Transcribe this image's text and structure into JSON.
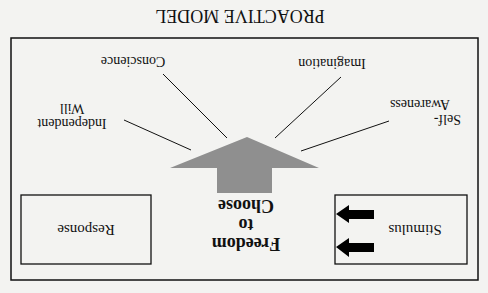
{
  "orientation": "rotated 180 degrees",
  "title": "PROACTIVE MODEL",
  "boxes": {
    "stimulus": "Stimulus",
    "response": "Response"
  },
  "center": {
    "line1": "Freedom",
    "line2": "to",
    "line3": "Choose"
  },
  "endowments": {
    "self_awareness_1": "Self-",
    "self_awareness_2": "Awareness",
    "imagination": "Imagination",
    "conscience": "Conscience",
    "independent_will_1": "Independent",
    "independent_will_2": "Will"
  },
  "colors": {
    "background": "#f3f3f1",
    "lines": "#111111",
    "big_arrow": "#8f8f8f",
    "small_arrows": "#000000"
  }
}
